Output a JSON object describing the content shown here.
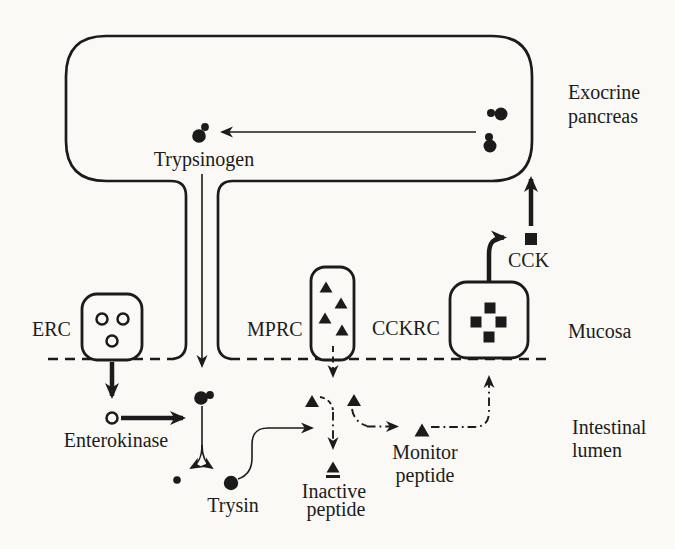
{
  "figure": {
    "colors": {
      "ink": "#1b1b1b",
      "background": "#faf9f5"
    },
    "regions": {
      "exocrine_pancreas": {
        "label_line1": "Exocrine",
        "label_line2": "pancreas"
      },
      "mucosa": {
        "label": "Mucosa"
      },
      "intestinal_lumen": {
        "label_line1": "Intestinal",
        "label_line2": "lumen"
      }
    },
    "nodes": {
      "trypsinogen": {
        "label": "Trypsinogen",
        "symbol": "large-filled-circle-with-small-dot"
      },
      "erc": {
        "label": "ERC",
        "symbol": "open-circles",
        "symbol_count": 3
      },
      "mprc": {
        "label": "MPRC",
        "symbol": "filled-triangles",
        "symbol_count": 4
      },
      "cckrc": {
        "label": "CCKRC",
        "symbol": "filled-squares",
        "symbol_count": 4
      },
      "cck": {
        "label": "CCK",
        "symbol": "filled-square"
      },
      "enterokinase": {
        "label": "Enterokinase",
        "symbol": "open-circle"
      },
      "trysin": {
        "label": "Trysin",
        "symbol": "filled-circle"
      },
      "inactive_peptide": {
        "label_line1": "Inactive",
        "label_line2": "peptide",
        "symbol": "filled-triangle-on-mound"
      },
      "monitor_peptide": {
        "label_line1": "Monitor",
        "label_line2": "peptide",
        "symbol": "filled-triangle"
      }
    },
    "connections": [
      {
        "from": "zymogen-granules",
        "to": "trypsinogen",
        "style": "thin-solid-arrow"
      },
      {
        "from": "trypsinogen",
        "to": "intestinal-lumen-via-duct",
        "style": "thin-solid-arrow"
      },
      {
        "from": "erc",
        "to": "enterokinase",
        "style": "thick-solid-arrow"
      },
      {
        "from": "enterokinase",
        "to": "trypsinogen-in-lumen",
        "style": "thick-solid-arrow"
      },
      {
        "from": "trypsinogen-in-lumen",
        "to": "trysin-and-peptide",
        "style": "thin-forked-arrow"
      },
      {
        "from": "trysin",
        "to": "monitor-peptide-cleavage",
        "style": "thin-solid-arrow"
      },
      {
        "from": "mprc",
        "to": "intestinal-lumen",
        "style": "dashed-arrow"
      },
      {
        "from": "cleaved-monitor-peptide",
        "to": "inactive-peptide",
        "style": "dash-dot-arrow"
      },
      {
        "from": "monitor-peptide",
        "to": "cckrc",
        "style": "dash-dot-arrow"
      },
      {
        "from": "cckrc",
        "to": "cck",
        "style": "thick-solid-arrow"
      },
      {
        "from": "cck",
        "to": "exocrine-pancreas",
        "style": "thick-solid-arrow"
      }
    ]
  }
}
